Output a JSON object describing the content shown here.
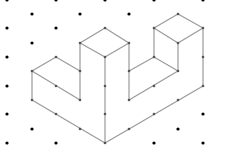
{
  "diagram": {
    "type": "isometric-dot-grid-drawing",
    "colors": {
      "grid_dot": "#000000",
      "edge": "#9a9a9a",
      "vertex": "#555555",
      "background": "#ffffff"
    },
    "grid": {
      "cols_x": [
        7,
        32,
        56,
        80,
        105,
        129,
        154,
        178,
        203
      ],
      "row_step": 14.3,
      "row_start": 0
    },
    "edges": [
      [
        [
          105,
          28
        ],
        [
          80,
          43
        ]
      ],
      [
        [
          105,
          28
        ],
        [
          129,
          43
        ]
      ],
      [
        [
          80,
          43
        ],
        [
          105,
          57
        ]
      ],
      [
        [
          129,
          43
        ],
        [
          105,
          57
        ]
      ],
      [
        [
          80,
          43
        ],
        [
          80,
          100
        ]
      ],
      [
        [
          129,
          43
        ],
        [
          129,
          100
        ]
      ],
      [
        [
          105,
          57
        ],
        [
          105,
          143
        ]
      ],
      [
        [
          32,
          71
        ],
        [
          56,
          57
        ]
      ],
      [
        [
          56,
          57
        ],
        [
          80,
          71
        ]
      ],
      [
        [
          32,
          71
        ],
        [
          80,
          100
        ]
      ],
      [
        [
          32,
          71
        ],
        [
          32,
          100
        ]
      ],
      [
        [
          32,
          100
        ],
        [
          105,
          143
        ]
      ],
      [
        [
          178,
          14
        ],
        [
          154,
          28
        ]
      ],
      [
        [
          178,
          14
        ],
        [
          203,
          28
        ]
      ],
      [
        [
          154,
          28
        ],
        [
          178,
          43
        ]
      ],
      [
        [
          203,
          28
        ],
        [
          178,
          43
        ]
      ],
      [
        [
          154,
          28
        ],
        [
          154,
          57
        ]
      ],
      [
        [
          178,
          43
        ],
        [
          178,
          71
        ]
      ],
      [
        [
          203,
          28
        ],
        [
          203,
          86
        ]
      ],
      [
        [
          154,
          57
        ],
        [
          129,
          71
        ]
      ],
      [
        [
          154,
          57
        ],
        [
          178,
          71
        ]
      ],
      [
        [
          178,
          71
        ],
        [
          129,
          100
        ]
      ],
      [
        [
          203,
          86
        ],
        [
          105,
          143
        ]
      ]
    ],
    "vertices": [
      [
        105,
        28
      ],
      [
        80,
        43
      ],
      [
        129,
        43
      ],
      [
        105,
        57
      ],
      [
        80,
        71
      ],
      [
        80,
        100
      ],
      [
        129,
        71
      ],
      [
        129,
        100
      ],
      [
        105,
        86
      ],
      [
        105,
        114
      ],
      [
        105,
        143
      ],
      [
        32,
        71
      ],
      [
        56,
        57
      ],
      [
        56,
        86
      ],
      [
        32,
        100
      ],
      [
        56,
        114
      ],
      [
        80,
        129
      ],
      [
        178,
        14
      ],
      [
        154,
        28
      ],
      [
        203,
        28
      ],
      [
        178,
        43
      ],
      [
        154,
        57
      ],
      [
        178,
        71
      ],
      [
        203,
        57
      ],
      [
        203,
        86
      ],
      [
        154,
        86
      ],
      [
        178,
        100
      ],
      [
        154,
        114
      ],
      [
        129,
        129
      ]
    ],
    "grid_dots": [
      [
        7,
        0
      ],
      [
        56,
        0
      ],
      [
        105,
        0
      ],
      [
        154,
        0
      ],
      [
        203,
        0
      ],
      [
        32,
        14
      ],
      [
        80,
        14
      ],
      [
        129,
        14
      ],
      [
        7,
        28
      ],
      [
        56,
        28
      ],
      [
        32,
        43
      ],
      [
        7,
        57
      ],
      [
        7,
        86
      ],
      [
        7,
        114
      ],
      [
        32,
        129
      ],
      [
        178,
        129
      ],
      [
        203,
        114
      ],
      [
        7,
        143
      ],
      [
        56,
        143
      ],
      [
        154,
        143
      ],
      [
        203,
        143
      ]
    ]
  }
}
